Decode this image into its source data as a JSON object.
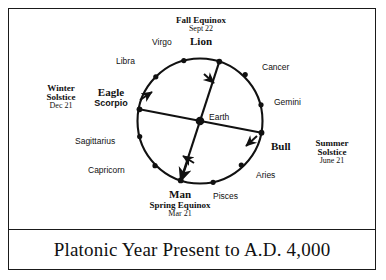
{
  "caption": {
    "text": "Platonic Year Present to A.D. 4,000"
  },
  "diagram": {
    "center_label": "Earth",
    "circle_color": "#111111",
    "text_color": "#111111"
  },
  "zodiac_signs": [
    {
      "name": "Virgo",
      "angle_deg": 105
    },
    {
      "name": "Libra",
      "angle_deg": 135
    },
    {
      "name": "Sagittarius",
      "angle_deg": 195
    },
    {
      "name": "Capricorn",
      "angle_deg": 225
    },
    {
      "name": "Pisces",
      "angle_deg": 285
    },
    {
      "name": "Aries",
      "angle_deg": 315
    },
    {
      "name": "Gemini",
      "angle_deg": 15
    },
    {
      "name": "Cancer",
      "angle_deg": 45
    }
  ],
  "ages": [
    {
      "name": "Lion",
      "alt": "",
      "angle_deg": 72
    },
    {
      "name": "Bull",
      "alt": "",
      "angle_deg": 349
    },
    {
      "name": "Man",
      "alt": "",
      "angle_deg": 252
    },
    {
      "name": "Eagle",
      "alt": "Scorpio",
      "angle_deg": 169
    }
  ],
  "season_markers": [
    {
      "title": "Fall Equinox",
      "date": "Sept 22",
      "position": "top"
    },
    {
      "title": "Summer Solstice",
      "date": "June 21",
      "position": "right"
    },
    {
      "title": "Spring Equinox",
      "date": "Mar 21",
      "position": "bottom"
    },
    {
      "title": "Winter Solstice",
      "date": "Dec 21",
      "position": "left"
    }
  ],
  "labels": {
    "fall_equinox": "Fall Equinox",
    "fall_equinox_date": "Sept 22",
    "lion": "Lion",
    "summer_solstice_l1": "Summer",
    "summer_solstice_l2": "Solstice",
    "summer_solstice_date": "June 21",
    "bull": "Bull",
    "spring_equinox": "Spring Equinox",
    "spring_equinox_date": "Mar 21",
    "man": "Man",
    "winter_solstice_l1": "Winter",
    "winter_solstice_l2": "Solstice",
    "winter_solstice_date": "Dec 21",
    "eagle": "Eagle",
    "scorpio": "Scorpio",
    "earth": "Earth",
    "virgo": "Virgo",
    "libra": "Libra",
    "sagittarius": "Sagittarius",
    "capricorn": "Capricorn",
    "pisces": "Pisces",
    "aries": "Aries",
    "gemini": "Gemini",
    "cancer": "Cancer"
  }
}
